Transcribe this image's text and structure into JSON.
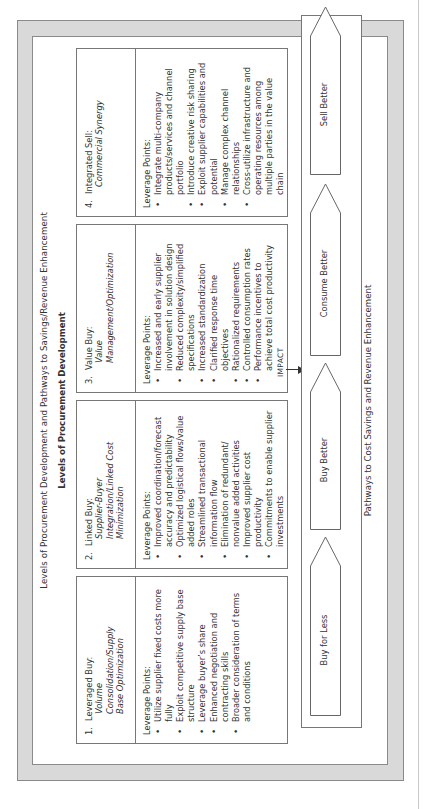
{
  "document": {
    "title": "Levels of Procurement Development and Pathways to Savings/Revenue Enhancement",
    "subtitle": "Levels of Procurement Development",
    "levels": [
      {
        "number": "1.",
        "name": "Leveraged Buy:",
        "focus": [
          "Volume",
          "Consolidation/Supply",
          "Base Optimization"
        ],
        "leverage_label": "Leverage Points:",
        "points": [
          "Utilize supplier fixed costs more fully",
          "Exploit competitive supply base structure",
          "Leverage buyer’s share",
          "Enhanced negotiation and contracting skills",
          "Broader consideration of terms and conditions"
        ]
      },
      {
        "number": "2.",
        "name": "Linked Buy:",
        "focus": [
          "Supplier-Buyer",
          "Integration/Linked Cost",
          "Minimization"
        ],
        "leverage_label": "Leverage Points:",
        "points": [
          "Improved coordination/forecast accuracy and predictability",
          "Optimized logistical flows/value added roles",
          "Streamlined transactional information flow",
          "Elimination of redundant/ nonvalue added activities",
          "Improved supplier cost productivity",
          "Commitments to enable supplier investments"
        ]
      },
      {
        "number": "3.",
        "name": "Value Buy:",
        "focus": [
          "Value",
          "Management/Optimization"
        ],
        "leverage_label": "Leverage Points:",
        "points": [
          "Increased and early supplier involvement in solution design",
          "Reduced complexity/simplified specifications",
          "Increased standardization",
          "Clarified response time objectives",
          "Rationalized requirements",
          "Controlled consumption rates",
          "Performance incentives to achieve total cost productivity"
        ]
      },
      {
        "number": "4.",
        "name": "Integrated Sell:",
        "focus": [
          "Commercial Synergy"
        ],
        "leverage_label": "Leverage Points:",
        "points": [
          "Integrate multi-company products/services and channel portfolio",
          "Introduce creative risk sharing",
          "Exploit supplier capabilities and potential",
          "Manage complex channel relationships",
          "Cross-utilize infrastructure and operating resources among multiple parties in the value chain"
        ]
      }
    ],
    "impact_label": "IMPACT",
    "pathways": [
      "Buy for Less",
      "Buy Better",
      "Consume Better",
      "Sell Better"
    ],
    "pathways_label": "Pathways to Cost Savings and Revenue Enhancement"
  }
}
